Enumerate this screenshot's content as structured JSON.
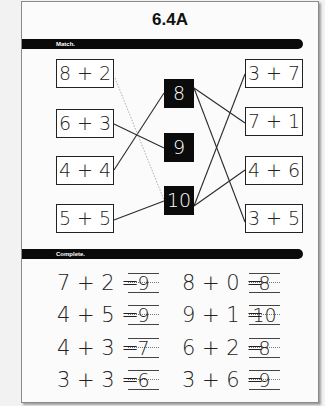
{
  "title": "6.4A",
  "sections": {
    "match": {
      "label": "Match.",
      "left": [
        "8 + 2",
        "6 + 3",
        "4 + 4",
        "5 + 5"
      ],
      "middle": [
        "8",
        "9",
        "10"
      ],
      "right": [
        "3 + 7",
        "7 + 1",
        "4 + 6",
        "3 + 5"
      ],
      "connections": [
        {
          "from": "6 + 3",
          "to": "9"
        },
        {
          "from": "4 + 4",
          "to": "8"
        },
        {
          "from": "5 + 5",
          "to": "10"
        },
        {
          "from": "8 + 2",
          "to": "10",
          "style": "dotted"
        },
        {
          "from": "8",
          "to": "7 + 1"
        },
        {
          "from": "8",
          "to": "3 + 5"
        },
        {
          "from": "10",
          "to": "3 + 7"
        },
        {
          "from": "10",
          "to": "4 + 6"
        }
      ]
    },
    "complete": {
      "label": "Complete.",
      "left_column": [
        {
          "equation": "7 + 2 =",
          "answer": "9"
        },
        {
          "equation": "4 + 5 =",
          "answer": "9"
        },
        {
          "equation": "4 + 3 =",
          "answer": "7"
        },
        {
          "equation": "3 + 3 =",
          "answer": "6"
        }
      ],
      "right_column": [
        {
          "equation": "8 + 0 =",
          "answer": "8"
        },
        {
          "equation": "9 + 1 =",
          "answer": "10"
        },
        {
          "equation": "6 + 2 =",
          "answer": "8"
        },
        {
          "equation": "3 + 6 =",
          "answer": "9"
        }
      ]
    }
  }
}
